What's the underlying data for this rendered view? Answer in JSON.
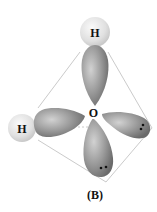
{
  "diagram": {
    "central_atom": {
      "label": "O"
    },
    "atoms": [
      {
        "id": "h-top",
        "label": "H"
      },
      {
        "id": "h-left",
        "label": "H"
      }
    ],
    "lobes": [
      {
        "id": "lobe-top",
        "bonded_to": "h-top",
        "lone_pair": false
      },
      {
        "id": "lobe-left",
        "bonded_to": "h-left",
        "lone_pair": false
      },
      {
        "id": "lobe-right",
        "bonded_to": null,
        "lone_pair": true
      },
      {
        "id": "lobe-bottom",
        "bonded_to": null,
        "lone_pair": true
      }
    ],
    "caption": "(B)",
    "colors": {
      "lobe": "#8a8a8a",
      "lobe_highlight": "#c8c8c8",
      "hydrogen": "#e2e2e2",
      "tetrahedron_edge": "#bdbdbd",
      "electron": "#111111"
    }
  }
}
